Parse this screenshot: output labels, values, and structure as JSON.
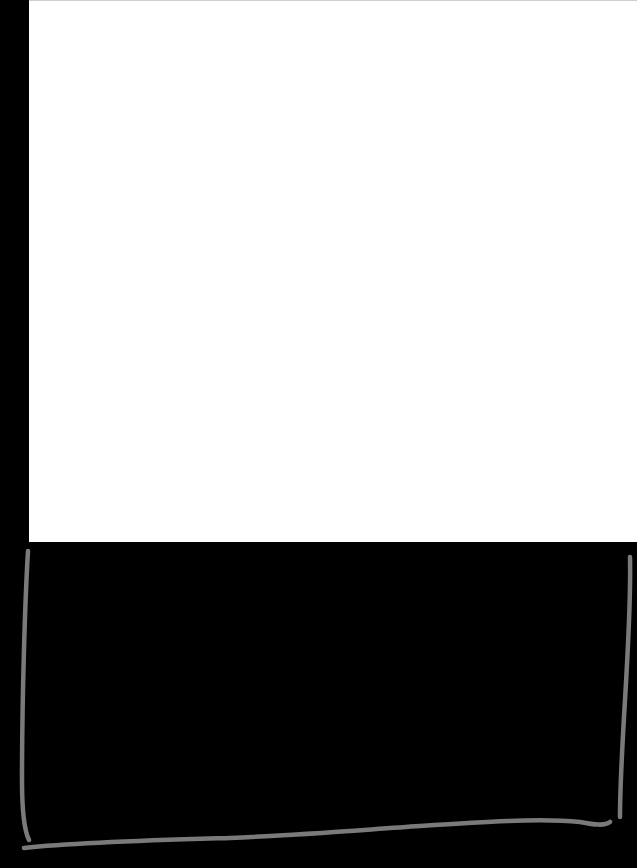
{
  "canvas": {
    "background_color": "#000000",
    "panel_color": "#ffffff",
    "stroke_color": "#7a7a7a"
  },
  "shapes": [
    {
      "type": "rectangle",
      "name": "white-panel",
      "color": "#ffffff"
    },
    {
      "type": "hand-drawn-bracket",
      "name": "u-shaped-bracket",
      "color": "#7a7a7a"
    }
  ]
}
